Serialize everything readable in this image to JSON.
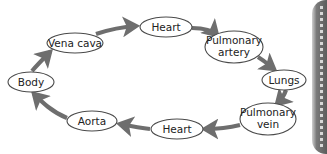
{
  "diagram": {
    "type": "cycle",
    "direction": "clockwise",
    "arrow_color": "#6e6e6e",
    "node_border_color": "#4a4a4a",
    "nodes": [
      {
        "id": "heart_top",
        "label_lines": [
          "Heart"
        ]
      },
      {
        "id": "pulmonary_artery",
        "label_lines": [
          "Pulmonary",
          "artery"
        ]
      },
      {
        "id": "lungs",
        "label_lines": [
          "Lungs"
        ]
      },
      {
        "id": "pulmonary_vein",
        "label_lines": [
          "Pulmonary",
          "vein"
        ]
      },
      {
        "id": "heart_bottom",
        "label_lines": [
          "Heart"
        ]
      },
      {
        "id": "aorta",
        "label_lines": [
          "Aorta"
        ]
      },
      {
        "id": "body",
        "label_lines": [
          "Body"
        ]
      },
      {
        "id": "vena_cava",
        "label_lines": [
          "Vena cava"
        ]
      }
    ],
    "edges": [
      {
        "from": "heart_top",
        "to": "pulmonary_artery"
      },
      {
        "from": "pulmonary_artery",
        "to": "lungs"
      },
      {
        "from": "lungs",
        "to": "pulmonary_vein"
      },
      {
        "from": "pulmonary_vein",
        "to": "heart_bottom"
      },
      {
        "from": "heart_bottom",
        "to": "aorta"
      },
      {
        "from": "aorta",
        "to": "body"
      },
      {
        "from": "body",
        "to": "vena_cava"
      },
      {
        "from": "vena_cava",
        "to": "heart_top"
      }
    ]
  }
}
